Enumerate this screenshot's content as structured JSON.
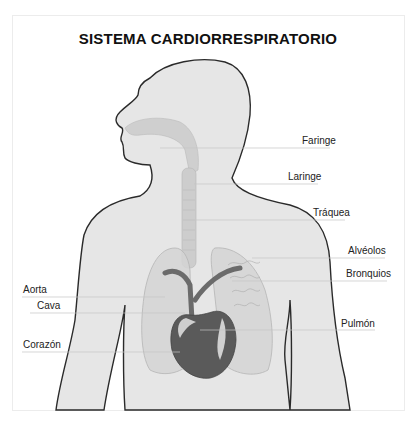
{
  "title": "SISTEMA CARDIORRESPIRATORIO",
  "labels": {
    "faringe": "Faringe",
    "laringe": "Laringe",
    "traquea": "Tráquea",
    "alveolos": "Alvéolos",
    "bronquios": "Bronquios",
    "pulmon": "Pulmón",
    "aorta": "Aorta",
    "cava": "Cava",
    "corazon": "Corazón"
  },
  "colors": {
    "body_fill": "#e6e6e6",
    "outline": "#2a2a2a",
    "organ_fill": "#c9c9c9",
    "heart_dark": "#555555",
    "leader_line": "#bdbdbd"
  }
}
